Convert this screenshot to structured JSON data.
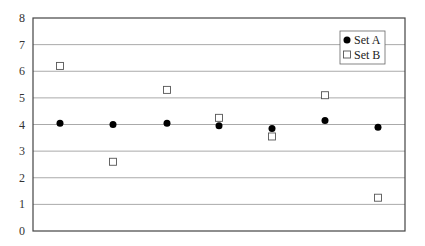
{
  "chart_data": {
    "type": "scatter",
    "title": "",
    "xlabel": "",
    "ylabel": "",
    "ylim": [
      0,
      8
    ],
    "yticks": [
      0,
      1,
      2,
      3,
      4,
      5,
      6,
      7,
      8
    ],
    "grid": true,
    "legend_position": "top-right",
    "x": [
      1,
      2,
      3,
      4,
      5,
      6,
      7
    ],
    "series": [
      {
        "name": "Set A",
        "marker": "filled-circle",
        "color": "#000000",
        "values": [
          4.05,
          4.0,
          4.05,
          3.95,
          3.85,
          4.15,
          3.9
        ]
      },
      {
        "name": "Set B",
        "marker": "open-square",
        "color": "#555555",
        "values": [
          6.2,
          2.6,
          5.3,
          4.25,
          3.55,
          5.1,
          1.25
        ]
      }
    ]
  }
}
